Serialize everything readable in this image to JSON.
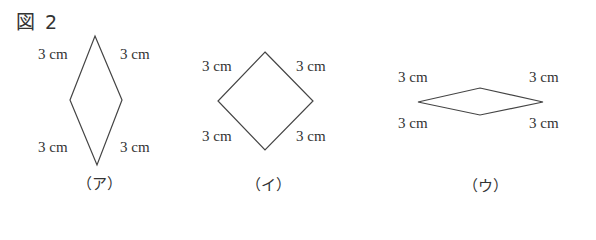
{
  "title": "図 2",
  "side_label": "3 cm",
  "figures": [
    {
      "caption": "（ア）",
      "shape": "rhombus-tall",
      "vertices": [
        [
          95,
          36
        ],
        [
          122,
          100
        ],
        [
          97,
          165
        ],
        [
          70,
          100
        ]
      ],
      "labels": [
        "3 cm",
        "3 cm",
        "3 cm",
        "3 cm"
      ]
    },
    {
      "caption": "（イ）",
      "shape": "square",
      "vertices": [
        [
          265,
          52
        ],
        [
          313,
          101
        ],
        [
          265,
          150
        ],
        [
          218,
          101
        ]
      ],
      "labels": [
        "3 cm",
        "3 cm",
        "3 cm",
        "3 cm"
      ]
    },
    {
      "caption": "（ウ）",
      "shape": "rhombus-flat",
      "vertices": [
        [
          480,
          88
        ],
        [
          543,
          102
        ],
        [
          480,
          115
        ],
        [
          418,
          102
        ]
      ],
      "labels": [
        "3 cm",
        "3 cm",
        "3 cm",
        "3 cm"
      ]
    }
  ],
  "colors": {
    "stroke": "#444444",
    "text": "#333333",
    "background": "#ffffff"
  }
}
